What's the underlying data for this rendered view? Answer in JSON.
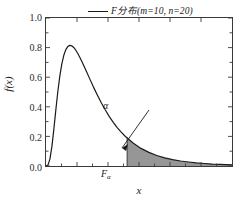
{
  "chart_data": {
    "type": "line",
    "title": "",
    "xlabel": "x",
    "ylabel": "f(x)",
    "xlim": [
      0,
      4.7
    ],
    "ylim": [
      0.0,
      1.0
    ],
    "grid": false,
    "legend_position": "top-right",
    "series": [
      {
        "name": "F分布(m=10, n=20)",
        "distribution": "F",
        "params": {
          "m": 10,
          "n": 20
        },
        "color": "#1a1a1a",
        "x": [
          0.0,
          0.05,
          0.1,
          0.15,
          0.2,
          0.25,
          0.3,
          0.35,
          0.4,
          0.45,
          0.5,
          0.55,
          0.6,
          0.65,
          0.7,
          0.75,
          0.8,
          0.85,
          0.9,
          0.95,
          1.0,
          1.1,
          1.2,
          1.3,
          1.4,
          1.5,
          1.6,
          1.7,
          1.8,
          1.9,
          2.0,
          2.2,
          2.4,
          2.6,
          2.8,
          3.0,
          3.2,
          3.4,
          3.6,
          3.8,
          4.0,
          4.2,
          4.4,
          4.7
        ],
        "y": [
          0.0,
          0.006,
          0.048,
          0.134,
          0.253,
          0.383,
          0.505,
          0.609,
          0.69,
          0.748,
          0.786,
          0.807,
          0.815,
          0.812,
          0.801,
          0.784,
          0.762,
          0.737,
          0.71,
          0.681,
          0.652,
          0.592,
          0.533,
          0.478,
          0.426,
          0.378,
          0.334,
          0.295,
          0.26,
          0.229,
          0.201,
          0.155,
          0.119,
          0.092,
          0.071,
          0.055,
          0.043,
          0.034,
          0.027,
          0.021,
          0.017,
          0.013,
          0.011,
          0.008
        ]
      }
    ],
    "ytick_labels": [
      "0.0",
      "0.2",
      "0.4",
      "0.6",
      "0.8",
      "1.0"
    ],
    "ytick_values": [
      0.0,
      0.2,
      0.4,
      0.6,
      0.8,
      1.0
    ],
    "xtick_labels": [
      "",
      "",
      "",
      "",
      ""
    ],
    "peak": {
      "x": 0.62,
      "y": 0.83
    },
    "shaded_region": {
      "label": "α",
      "fill_color": "#969696",
      "from_x": 2.05,
      "to_x": 4.7,
      "boundary_label": "F",
      "boundary_label_subscript": "α",
      "boundary_y_top": 0.195
    },
    "annotations": [
      {
        "name": "alpha",
        "text": "α",
        "x": 2.75,
        "y": 0.44
      },
      {
        "name": "critical-value",
        "text": "F",
        "subscript": "α",
        "x": 2.05,
        "y": -0.05
      }
    ]
  },
  "legend": {
    "entries": [
      {
        "label": "F分布(m=10, n=20)",
        "color": "#1a1a1a"
      }
    ]
  },
  "axes": {
    "ylabel": "f(x)",
    "xlabel": "x",
    "yticks": [
      "1.0",
      "0.8",
      "0.6",
      "0.4",
      "0.2",
      "0.0"
    ]
  },
  "annotations": {
    "alpha": "α",
    "fa_base": "F",
    "fa_sub": "α"
  },
  "colors": {
    "curve": "#1a1a1a",
    "shade": "#969696",
    "frame": "#3a3a3a",
    "background": "#ffffff"
  }
}
